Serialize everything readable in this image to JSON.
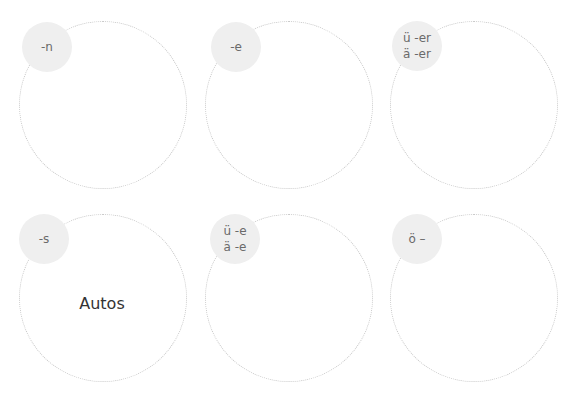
{
  "groups": [
    {
      "label_lines": [
        "-n"
      ],
      "words": []
    },
    {
      "label_lines": [
        "-e"
      ],
      "words": []
    },
    {
      "label_lines": [
        "ü -er",
        "ä -er"
      ],
      "words": []
    },
    {
      "label_lines": [
        "-s"
      ],
      "words": [
        "Autos"
      ]
    },
    {
      "label_lines": [
        "ü -e",
        "ä -e"
      ],
      "words": []
    },
    {
      "label_lines": [
        "ö –"
      ],
      "words": []
    }
  ]
}
